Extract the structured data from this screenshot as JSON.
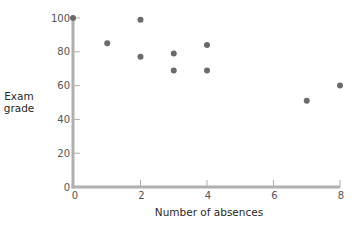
{
  "chart_data": {
    "type": "scatter",
    "title": "",
    "xlabel": "Number of absences",
    "ylabel": "Exam grade",
    "xlim": [
      0,
      8
    ],
    "ylim": [
      0,
      100
    ],
    "x_ticks": [
      0,
      2,
      4,
      6,
      8
    ],
    "y_ticks": [
      0,
      20,
      40,
      60,
      80,
      100
    ],
    "grid": false,
    "legend": null,
    "series": [
      {
        "name": "Students",
        "color": "#6b6b6b",
        "points": [
          {
            "x": 0,
            "y": 100
          },
          {
            "x": 1,
            "y": 85
          },
          {
            "x": 2,
            "y": 99
          },
          {
            "x": 2,
            "y": 77
          },
          {
            "x": 3,
            "y": 79
          },
          {
            "x": 3,
            "y": 69
          },
          {
            "x": 4,
            "y": 84
          },
          {
            "x": 4,
            "y": 69
          },
          {
            "x": 7,
            "y": 51
          },
          {
            "x": 8,
            "y": 60
          }
        ]
      }
    ]
  },
  "colors": {
    "axis": "#b0b0b0",
    "point": "#6b6b6b"
  }
}
